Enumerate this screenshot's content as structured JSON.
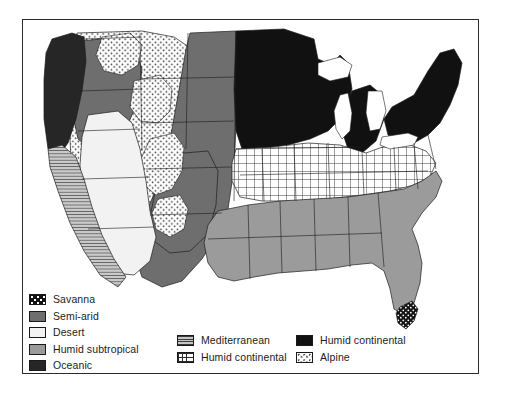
{
  "figure": {
    "type": "thematic-choropleth-map",
    "region": "Contiguous United States",
    "frame_color": "#2b2b2b",
    "background_color": "#ffffff"
  },
  "legend": {
    "columns": [
      {
        "id": "legend-column-1",
        "items": [
          {
            "label": "Savanna",
            "pattern": "sw-savanna",
            "color": "#131313",
            "description": "black with white dots"
          },
          {
            "label": "Semi-arid",
            "pattern": "sw-semiarid",
            "color": "#6e6e6e",
            "description": "solid medium-dark gray"
          },
          {
            "label": "Desert",
            "pattern": "sw-desert",
            "color": "#f2f2f2",
            "description": "near white"
          },
          {
            "label": "Humid subtropical",
            "pattern": "sw-humidsub",
            "color": "#9b9b9b",
            "description": "solid medium gray"
          },
          {
            "label": "Oceanic",
            "pattern": "sw-oceanic",
            "color": "#262626",
            "description": "solid very dark gray"
          }
        ]
      },
      {
        "id": "legend-column-2",
        "items": [
          {
            "label": "Mediterranean",
            "pattern": "sw-mediterranean",
            "color": "#8a8a8a",
            "description": "horizontal line hatch"
          },
          {
            "label": "Humid continental",
            "pattern": "sw-humidcont-grid",
            "color": "#ffffff",
            "description": "square grid crosshatch"
          }
        ]
      },
      {
        "id": "legend-column-3",
        "items": [
          {
            "label": "Humid continental",
            "pattern": "sw-humidcont-dark",
            "color": "#111111",
            "description": "solid black"
          },
          {
            "label": "Alpine",
            "pattern": "sw-alpine",
            "color": "#ffffff",
            "description": "white with fine stipple dots"
          }
        ]
      }
    ]
  },
  "map_regions": [
    {
      "name": "Pacific Northwest coast",
      "climate": "Oceanic"
    },
    {
      "name": "California coast",
      "climate": "Mediterranean"
    },
    {
      "name": "Great Basin and Southwest",
      "climate": "Desert"
    },
    {
      "name": "Rocky Mountains",
      "climate": "Alpine"
    },
    {
      "name": "Great Plains",
      "climate": "Semi-arid"
    },
    {
      "name": "Upper Midwest and Northern New England",
      "climate": "Humid continental"
    },
    {
      "name": "Ohio Valley and Mid-Atlantic",
      "climate": "Humid continental"
    },
    {
      "name": "Southeast and Gulf Coast",
      "climate": "Humid subtropical"
    },
    {
      "name": "Southern Florida",
      "climate": "Savanna"
    }
  ]
}
